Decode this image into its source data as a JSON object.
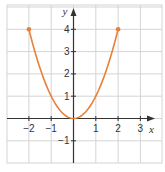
{
  "chart_data": {
    "type": "line",
    "title": "",
    "xlabel": "x",
    "ylabel": "y",
    "xlim": [
      -3,
      3.5
    ],
    "ylim": [
      -2,
      5
    ],
    "grid": true,
    "function": "y = x^2",
    "domain": [
      -2,
      2
    ],
    "series": [
      {
        "name": "y = x^2",
        "color": "#e8803a",
        "x": [
          -2,
          -1.5,
          -1,
          -0.5,
          0,
          0.5,
          1,
          1.5,
          2
        ],
        "y": [
          4,
          2.25,
          1,
          0.25,
          0,
          0.25,
          1,
          2.25,
          4
        ]
      }
    ],
    "endpoints": [
      {
        "x": -2,
        "y": 4,
        "closed": true
      },
      {
        "x": 2,
        "y": 4,
        "closed": true
      }
    ],
    "x_ticks": [
      -2,
      -1,
      1,
      2,
      3
    ],
    "y_ticks": [
      4,
      3,
      2,
      1,
      -1
    ],
    "x_tick_labels": [
      "−2",
      "−1",
      "1",
      "2",
      "3"
    ],
    "y_tick_labels": [
      "4",
      "3",
      "2",
      "1",
      "−1"
    ]
  },
  "colors": {
    "curve": "#e8803a",
    "grid": "#d4d4d4",
    "axis": "#333333"
  }
}
